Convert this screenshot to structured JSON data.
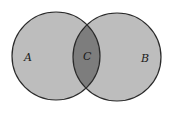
{
  "diagram": {
    "type": "venn",
    "sets": [
      {
        "id": "A",
        "label": "A",
        "cx": 56,
        "cy": 56,
        "r": 44
      },
      {
        "id": "B",
        "label": "B",
        "cx": 117,
        "cy": 57,
        "r": 44
      }
    ],
    "intersection": {
      "label": "C"
    },
    "colors": {
      "set_fill": "#bdbdbd",
      "intersection_fill": "#7d7d7d",
      "stroke": "#2a2a2a",
      "background": "#ffffff"
    }
  }
}
